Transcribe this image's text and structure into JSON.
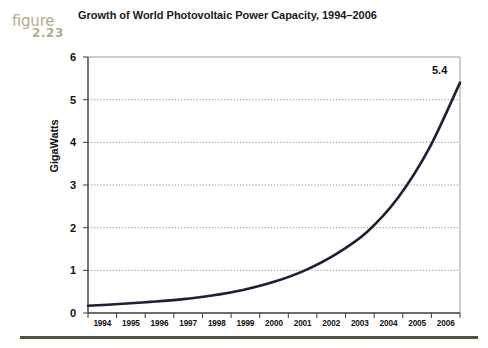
{
  "figure": {
    "word": "figure",
    "number": "2.23",
    "color": "#b3ab8d"
  },
  "title": "Growth of World Photovoltaic Power Capacity, 1994–2006",
  "annotation": {
    "endpoint_value": "5.4"
  },
  "colors": {
    "line": "#1d1f35",
    "gridline": "#8d8d8d",
    "frame": "#4a4a4a",
    "rule": "#4c5340",
    "text": "#111111"
  },
  "chart_data": {
    "type": "line",
    "title": "Growth of World Photovoltaic Power Capacity, 1994–2006",
    "xlabel": "",
    "ylabel": "GigaWatts",
    "x": [
      1994,
      1995,
      1996,
      1997,
      1998,
      1999,
      2000,
      2001,
      2002,
      2003,
      2004,
      2005,
      2006
    ],
    "categories": [
      "1994",
      "1995",
      "1996",
      "1997",
      "1998",
      "1999",
      "2000",
      "2001",
      "2002",
      "2003",
      "2004",
      "2005",
      "2006"
    ],
    "series": [
      {
        "name": "World Photovoltaic Power Capacity",
        "values": [
          0.17,
          0.21,
          0.26,
          0.32,
          0.41,
          0.54,
          0.73,
          1.0,
          1.38,
          1.9,
          2.7,
          3.85,
          5.4
        ]
      }
    ],
    "ylim": [
      0,
      6
    ],
    "yticks": [
      0,
      1,
      2,
      3,
      4,
      5,
      6
    ],
    "ytick_labels": [
      "0",
      "1",
      "2",
      "3",
      "4",
      "5",
      "6"
    ],
    "xtick_labels": [
      "1994",
      "1995",
      "1996",
      "1997",
      "1998",
      "1999",
      "2000",
      "2001",
      "2002",
      "2003",
      "2004",
      "2005",
      "2006"
    ],
    "grid": "horizontal-dotted",
    "legend": "none",
    "annotations": [
      {
        "text": "5.4",
        "x": 2006,
        "y": 5.4
      }
    ]
  }
}
